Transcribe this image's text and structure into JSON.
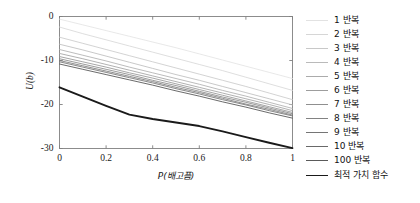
{
  "chart_data": {
    "type": "line",
    "title": "",
    "xlabel": "P(배고픔)",
    "ylabel": "U(b)",
    "xlim": [
      0,
      1
    ],
    "ylim": [
      -30,
      0
    ],
    "xticks": [
      "0",
      "0.2",
      "0.4",
      "0.6",
      "0.8",
      "1"
    ],
    "xtick_values": [
      0,
      0.2,
      0.4,
      0.6,
      0.8,
      1
    ],
    "yticks": [
      "0",
      "-10",
      "-20",
      "-30"
    ],
    "ytick_values": [
      0,
      -10,
      -20,
      -30
    ],
    "grid": false,
    "legend_position": "right",
    "x": [
      0,
      0.1,
      0.2,
      0.3,
      0.4,
      0.5,
      0.6,
      0.7,
      0.8,
      0.9,
      1
    ],
    "series": [
      {
        "name": "1 반복",
        "color": "#e2e2e2",
        "width": 0.8,
        "values": [
          -0.6,
          -1.9,
          -3.2,
          -4.5,
          -5.8,
          -7.1,
          -8.5,
          -9.9,
          -11.3,
          -12.7,
          -14.1
        ]
      },
      {
        "name": "2 반복",
        "color": "#d6d6d6",
        "width": 0.8,
        "values": [
          -2.4,
          -3.9,
          -5.3,
          -6.7,
          -8.1,
          -9.5,
          -10.9,
          -12.3,
          -13.8,
          -15.3,
          -16.8
        ]
      },
      {
        "name": "3 반복",
        "color": "#c8c8c8",
        "width": 0.8,
        "values": [
          -4.7,
          -6.1,
          -7.5,
          -8.9,
          -10.3,
          -11.7,
          -13.1,
          -14.5,
          -15.9,
          -17.4,
          -18.9
        ]
      },
      {
        "name": "4 반복",
        "color": "#bababa",
        "width": 0.8,
        "values": [
          -6.3,
          -7.6,
          -9.0,
          -10.4,
          -11.8,
          -13.2,
          -14.5,
          -15.9,
          -17.3,
          -18.7,
          -20.1
        ]
      },
      {
        "name": "5 반복",
        "color": "#ababab",
        "width": 0.8,
        "values": [
          -7.5,
          -8.8,
          -10.1,
          -11.5,
          -12.8,
          -14.1,
          -15.4,
          -16.8,
          -18.1,
          -19.5,
          -20.9
        ]
      },
      {
        "name": "6 반복",
        "color": "#9d9d9d",
        "width": 0.8,
        "values": [
          -8.4,
          -9.6,
          -10.9,
          -12.2,
          -13.5,
          -14.8,
          -16.1,
          -17.4,
          -18.7,
          -20.0,
          -21.4
        ]
      },
      {
        "name": "7 반복",
        "color": "#8f8f8f",
        "width": 0.8,
        "values": [
          -9.1,
          -10.3,
          -11.5,
          -12.8,
          -14.0,
          -15.3,
          -16.6,
          -17.9,
          -19.2,
          -20.5,
          -21.8
        ]
      },
      {
        "name": "8 반복",
        "color": "#828282",
        "width": 0.8,
        "values": [
          -9.6,
          -10.8,
          -12.0,
          -13.2,
          -14.5,
          -15.7,
          -17.0,
          -18.3,
          -19.5,
          -20.8,
          -22.1
        ]
      },
      {
        "name": "9 반복",
        "color": "#757575",
        "width": 0.8,
        "values": [
          -10.0,
          -11.2,
          -12.4,
          -13.6,
          -14.8,
          -16.1,
          -17.3,
          -18.6,
          -19.9,
          -21.1,
          -22.4
        ]
      },
      {
        "name": "10 반복",
        "color": "#696969",
        "width": 0.8,
        "values": [
          -10.3,
          -11.5,
          -12.7,
          -13.9,
          -15.1,
          -16.4,
          -17.6,
          -18.9,
          -20.1,
          -21.4,
          -22.6
        ]
      },
      {
        "name": "100 반복",
        "color": "#5a5a5a",
        "width": 0.9,
        "values": [
          -10.8,
          -12.0,
          -13.2,
          -14.4,
          -15.6,
          -16.9,
          -18.1,
          -19.4,
          -20.6,
          -21.9,
          -23.1
        ]
      },
      {
        "name": "최적 가치 함수",
        "color": "#1a1a1a",
        "width": 1.9,
        "values": [
          -16.1,
          -18.2,
          -20.3,
          -22.3,
          -23.3,
          -24.1,
          -24.9,
          -26.1,
          -27.4,
          -28.7,
          -29.9
        ]
      }
    ]
  }
}
